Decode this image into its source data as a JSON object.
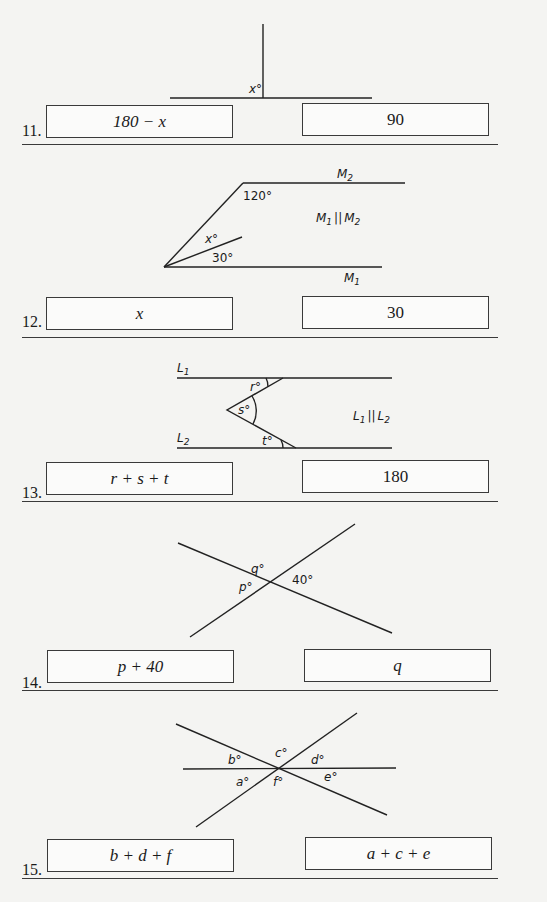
{
  "problems": [
    {
      "number": "11.",
      "column_a": "180 − x",
      "column_b": "90",
      "figure": {
        "labels": [
          "x°"
        ]
      }
    },
    {
      "number": "12.",
      "column_a": "x",
      "column_b": "30",
      "figure": {
        "labels": [
          "M2",
          "120°",
          "M1 || M2",
          "x°",
          "30°",
          "M1"
        ]
      }
    },
    {
      "number": "13.",
      "column_a": "r + s + t",
      "column_b": "180",
      "figure": {
        "labels": [
          "L1",
          "r°",
          "s°",
          "L1 || L2",
          "L2",
          "t°"
        ]
      }
    },
    {
      "number": "14.",
      "column_a": "p + 40",
      "column_b": "q",
      "figure": {
        "labels": [
          "q°",
          "p°",
          "40°"
        ]
      }
    },
    {
      "number": "15.",
      "column_a": "b + d + f",
      "column_b": "a + c + e",
      "figure": {
        "labels": [
          "b°",
          "c°",
          "d°",
          "a°",
          "f°",
          "e°"
        ]
      }
    }
  ],
  "labels": {
    "p11_x": "x°",
    "p12_M2": "M",
    "p12_M2_sub": "2",
    "p12_120": "120°",
    "p12_par_a": "M",
    "p12_par_a_sub": "1",
    "p12_par_mid": "||",
    "p12_par_b": "M",
    "p12_par_b_sub": "2",
    "p12_x": "x°",
    "p12_30": "30°",
    "p12_M1": "M",
    "p12_M1_sub": "1",
    "p13_L1": "L",
    "p13_L1_sub": "1",
    "p13_r": "r°",
    "p13_s": "s°",
    "p13_par_a": "L",
    "p13_par_a_sub": "1",
    "p13_par_mid": "||",
    "p13_par_b": "L",
    "p13_par_b_sub": "2",
    "p13_L2": "L",
    "p13_L2_sub": "2",
    "p13_t": "t°",
    "p14_q": "q°",
    "p14_p": "p°",
    "p14_40": "40°",
    "p15_b": "b°",
    "p15_c": "c°",
    "p15_d": "d°",
    "p15_a": "a°",
    "p15_f": "f°",
    "p15_e": "e°"
  }
}
